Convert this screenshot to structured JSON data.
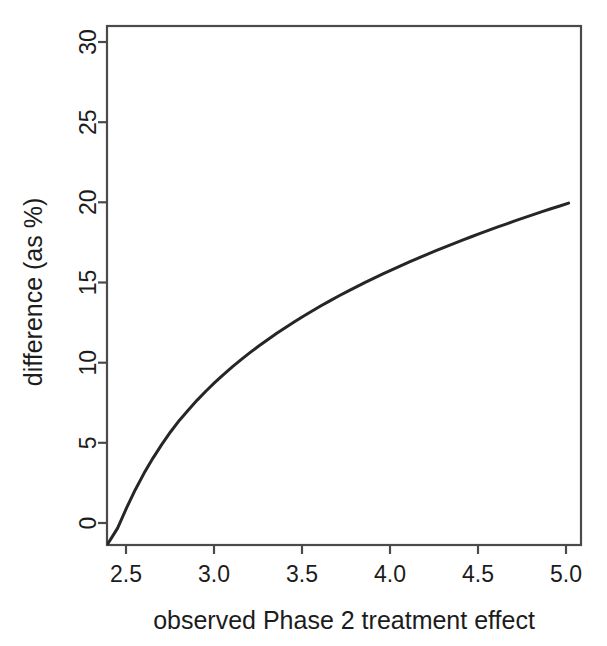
{
  "chart_data": {
    "type": "line",
    "title": "",
    "subtitle": "",
    "xlabel": "observed Phase 2 treatment effect",
    "ylabel": "difference (as %)",
    "xlim": [
      2.39,
      5.07
    ],
    "ylim": [
      -1.45,
      31.4
    ],
    "xticks": [
      2.5,
      3.0,
      3.5,
      4.0,
      4.5,
      5.0
    ],
    "xtick_labels": [
      "2.5",
      "3.0",
      "3.5",
      "4.0",
      "4.5",
      "5.0"
    ],
    "yticks": [
      0,
      5,
      10,
      15,
      20,
      25,
      30
    ],
    "ytick_labels": [
      "0",
      "5",
      "10",
      "15",
      "20",
      "25",
      "30"
    ],
    "grid": false,
    "legend": false,
    "legend_position": "none",
    "box": true,
    "ytick_label_rotation": 90,
    "series": [
      {
        "name": "difference",
        "color": "#262626",
        "x": [
          2.39,
          2.42,
          2.45,
          2.5,
          2.55,
          2.6,
          2.65,
          2.7,
          2.75,
          2.8,
          2.85,
          2.9,
          2.95,
          3.0,
          3.05,
          3.1,
          3.15,
          3.2,
          3.25,
          3.3,
          3.35,
          3.4,
          3.45,
          3.5,
          3.55,
          3.6,
          3.65,
          3.7,
          3.75,
          3.8,
          3.85,
          3.9,
          3.95,
          4.0,
          4.05,
          4.1,
          4.15,
          4.2,
          4.25,
          4.3,
          4.35,
          4.4,
          4.45,
          4.5,
          4.55,
          4.6,
          4.65,
          4.7,
          4.75,
          4.8,
          4.85,
          4.9,
          4.95,
          5.0
        ],
        "y": [
          -1.45,
          -0.92,
          -0.38,
          0.88,
          2.05,
          3.1,
          4.05,
          4.92,
          5.72,
          6.45,
          7.1,
          7.72,
          8.3,
          8.84,
          9.35,
          9.84,
          10.3,
          10.74,
          11.16,
          11.56,
          11.95,
          12.32,
          12.68,
          13.03,
          13.36,
          13.69,
          14.0,
          14.31,
          14.6,
          14.89,
          15.17,
          15.44,
          15.71,
          15.97,
          16.22,
          16.47,
          16.71,
          16.95,
          17.18,
          17.41,
          17.63,
          17.85,
          18.06,
          18.27,
          18.48,
          18.68,
          18.88,
          19.08,
          19.27,
          19.46,
          19.65,
          19.83,
          20.01,
          20.19
        ]
      }
    ],
    "annotations": []
  },
  "figure": {
    "background_color": "#ffffff",
    "line_color": "#262626",
    "axis_color": "#4a4a4a"
  }
}
